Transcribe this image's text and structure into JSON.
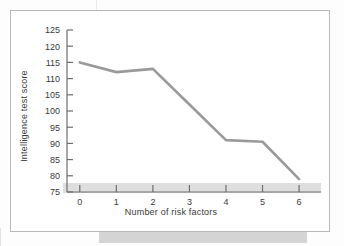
{
  "figure": {
    "frame_color": "#b9b9b9",
    "background": "#ffffff"
  },
  "chart_data": {
    "type": "line",
    "title": "",
    "xlabel": "Number of risk factors",
    "ylabel": "Intelligence test score",
    "x": [
      0,
      1,
      2,
      3,
      4,
      5,
      6
    ],
    "values": [
      115,
      112,
      113,
      102,
      91,
      90.5,
      79
    ],
    "xticklabels": [
      "0",
      "1",
      "2",
      "3",
      "4",
      "5",
      "6"
    ],
    "yticklabels": [
      "75",
      "80",
      "85",
      "90",
      "95",
      "100",
      "105",
      "110",
      "115",
      "120",
      "125"
    ],
    "yticks": [
      75,
      80,
      85,
      90,
      95,
      100,
      105,
      110,
      115,
      120,
      125
    ],
    "xlim": [
      -0.35,
      6.6
    ],
    "ylim": [
      75,
      125
    ],
    "grid": false,
    "legend": false,
    "line_color": "#9a9a9a",
    "axis_color": "#6e6e6e",
    "band_color": "#d4d4d4"
  }
}
